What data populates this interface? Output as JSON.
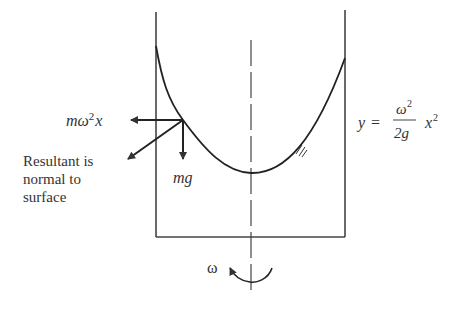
{
  "diagram": {
    "type": "rotating-fluid-container",
    "labels": {
      "centrifugal_force": {
        "m": "m",
        "omega": "ω",
        "exp": "2",
        "x": "x"
      },
      "weight": "mg",
      "resultant": [
        "Resultant is",
        "normal to",
        "surface"
      ],
      "equation": {
        "lhs": "y",
        "eq": "=",
        "num": "ω",
        "num_exp": "2",
        "den": "2g",
        "x": "x",
        "x_exp": "2"
      },
      "rotation": "ω"
    },
    "colors": {
      "line": "#333333",
      "background": "#ffffff"
    }
  }
}
